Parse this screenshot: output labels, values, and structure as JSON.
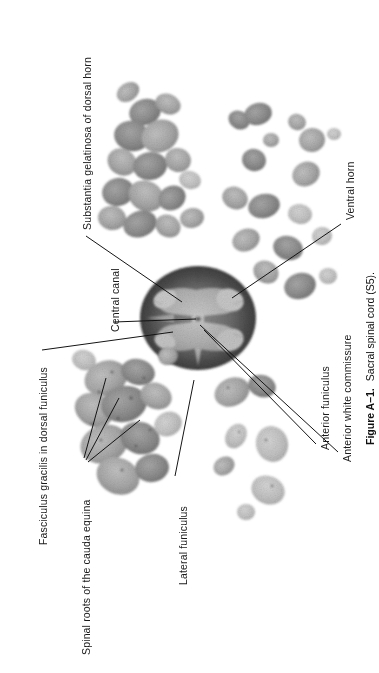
{
  "figure": {
    "number": "Figure A–1.",
    "caption": "Sacral spinal cord (S5).",
    "type": "histological-photomicrograph"
  },
  "labels": [
    {
      "id": "substantia-gelatinosa",
      "text": "Substantia gelatinosa of dorsal horn",
      "text_x": 82,
      "text_y": 230,
      "leader": {
        "x1": 86,
        "y1": 236,
        "x2": 182,
        "y2": 302
      }
    },
    {
      "id": "central-canal",
      "text": "Central canal",
      "text_x": 110,
      "text_y": 332,
      "leader": {
        "x1": 114,
        "y1": 322,
        "x2": 196,
        "y2": 319
      }
    },
    {
      "id": "ventral-horn",
      "text": "Ventral horn",
      "text_x": 345,
      "text_y": 220,
      "leader": {
        "x1": 341,
        "y1": 224,
        "x2": 232,
        "y2": 298
      }
    },
    {
      "id": "anterior-funiculus",
      "text": "Anterior funiculus",
      "text_x": 320,
      "text_y": 450,
      "leader": {
        "x1": 316,
        "y1": 444,
        "x2": 204,
        "y2": 330
      }
    },
    {
      "id": "anterior-white-commissure",
      "text": "Anterior white commissure",
      "text_x": 342,
      "text_y": 462,
      "leader": {
        "x1": 338,
        "y1": 452,
        "x2": 200,
        "y2": 325
      }
    },
    {
      "id": "fasciculus-gracilis",
      "text": "Fasciculus gracilis in dorsal funiculus",
      "text_x": 38,
      "text_y": 545,
      "leader": {
        "x1": 42,
        "y1": 350,
        "x2": 173,
        "y2": 332
      }
    },
    {
      "id": "spinal-roots-cauda-equina",
      "text": "Spinal roots of the cauda equina",
      "text_x": 81,
      "text_y": 655,
      "leaders": [
        {
          "x1": 84,
          "y1": 458,
          "x2": 106,
          "y2": 378
        },
        {
          "x1": 86,
          "y1": 460,
          "x2": 119,
          "y2": 398
        },
        {
          "x1": 88,
          "y1": 462,
          "x2": 140,
          "y2": 420
        }
      ]
    },
    {
      "id": "lateral-funiculus",
      "text": "Lateral funiculus",
      "text_x": 178,
      "text_y": 585,
      "leader": {
        "x1": 175,
        "y1": 476,
        "x2": 194,
        "y2": 380
      }
    }
  ],
  "colors": {
    "background": "#ffffff",
    "text": "#1a1a1a",
    "leader_line": "#141414",
    "tissue_light": "#b9b9b9",
    "tissue_mid": "#9a9a9a",
    "tissue_dark": "#6f6f6f",
    "white_matter_dark": "#4a4a4a"
  }
}
